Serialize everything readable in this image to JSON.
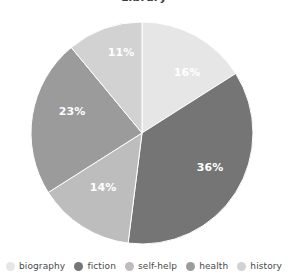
{
  "chart_data": {
    "type": "pie",
    "title": "Library",
    "categories": [
      "biography",
      "fiction",
      "self-help",
      "health",
      "history"
    ],
    "values": [
      16,
      36,
      14,
      23,
      11
    ],
    "value_labels": [
      "16%",
      "36%",
      "14%",
      "23%",
      "11%"
    ],
    "unit": "percent",
    "colors": [
      "#e6e6e6",
      "#757575",
      "#bdbdbd",
      "#9b9b9b",
      "#d2d2d2"
    ],
    "label_color": "#ffffff",
    "background": "#ffffff",
    "start_angle_deg": 0,
    "direction": "clockwise",
    "legend_position": "bottom",
    "grid": false,
    "xlabel": "",
    "ylabel": "",
    "slices": [
      {
        "name": "biography",
        "value": 16,
        "label": "16%",
        "color": "#e6e6e6",
        "label_x": 187,
        "label_y": 73
      },
      {
        "name": "fiction",
        "value": 36,
        "label": "36%",
        "color": "#757575",
        "label_x": 210,
        "label_y": 168
      },
      {
        "name": "self-help",
        "value": 14,
        "label": "14%",
        "color": "#bdbdbd",
        "label_x": 103,
        "label_y": 188
      },
      {
        "name": "health",
        "value": 23,
        "label": "23%",
        "color": "#9b9b9b",
        "label_x": 72,
        "label_y": 112
      },
      {
        "name": "history",
        "value": 11,
        "label": "11%",
        "color": "#d2d2d2",
        "label_x": 121,
        "label_y": 53
      }
    ]
  },
  "legend": {
    "items": [
      {
        "label": "biography",
        "color": "#e6e6e6"
      },
      {
        "label": "fiction",
        "color": "#757575"
      },
      {
        "label": "self-help",
        "color": "#bdbdbd"
      },
      {
        "label": "health",
        "color": "#9b9b9b"
      },
      {
        "label": "history",
        "color": "#d2d2d2"
      }
    ]
  }
}
